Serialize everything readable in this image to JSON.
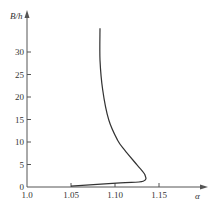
{
  "chart_data": {
    "type": "line",
    "title": "",
    "xlabel": "α",
    "ylabel": "B/h",
    "xlim": [
      1.0,
      1.2
    ],
    "ylim": [
      0,
      37
    ],
    "x_ticks": [
      "1.0",
      "1.05",
      "1.10",
      "1.15"
    ],
    "y_ticks": [
      "0",
      "5",
      "10",
      "15",
      "20",
      "25",
      "30"
    ],
    "grid": false,
    "legend": null,
    "series": [
      {
        "name": "curve",
        "points": [
          {
            "x": 1.05,
            "y": 0.2
          },
          {
            "x": 1.106,
            "y": 0.9
          },
          {
            "x": 1.132,
            "y": 1.3
          },
          {
            "x": 1.134,
            "y": 2.7
          },
          {
            "x": 1.125,
            "y": 4.9
          },
          {
            "x": 1.111,
            "y": 8.2
          },
          {
            "x": 1.103,
            "y": 10.4
          },
          {
            "x": 1.093,
            "y": 14.9
          },
          {
            "x": 1.086,
            "y": 21.6
          },
          {
            "x": 1.083,
            "y": 28.2
          },
          {
            "x": 1.083,
            "y": 35.3
          }
        ]
      }
    ]
  },
  "colors": {
    "axis": "#555555",
    "curve": "#333333"
  }
}
